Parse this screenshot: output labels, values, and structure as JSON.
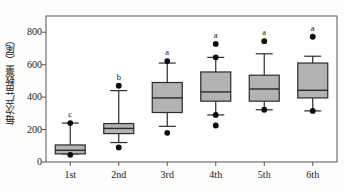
{
  "chart_data": {
    "type": "box",
    "title": "",
    "xlabel": "",
    "ylabel": "每次产苗数量（尾）",
    "ylim": [
      0,
      900
    ],
    "yticks": [
      0,
      200,
      400,
      600,
      800
    ],
    "ytick_labels": [
      "0",
      "200",
      "400",
      "600",
      "800"
    ],
    "grid": false,
    "legend": null,
    "categories": [
      "1st",
      "2nd",
      "3rd",
      "4th",
      "5th",
      "6th"
    ],
    "box_fill": "#b3b3b3",
    "box_edge": "#2b2b2b",
    "series": [
      {
        "name": "1st",
        "category": "1st",
        "q1": 50,
        "median": 72,
        "q3": 105,
        "whisker_low": 50,
        "whisker_high": 240,
        "outliers": [
          44,
          240
        ],
        "sig_letter": "c"
      },
      {
        "name": "2nd",
        "category": "2nd",
        "q1": 175,
        "median": 207,
        "q3": 237,
        "whisker_low": 120,
        "whisker_high": 440,
        "outliers": [
          90,
          470
        ],
        "sig_letter": "b"
      },
      {
        "name": "3rd",
        "category": "3rd",
        "q1": 305,
        "median": 395,
        "q3": 490,
        "whisker_low": 220,
        "whisker_high": 610,
        "outliers": [
          180,
          622
        ],
        "sig_letter": "a"
      },
      {
        "name": "4th",
        "category": "4th",
        "q1": 375,
        "median": 432,
        "q3": 555,
        "whisker_low": 290,
        "whisker_high": 645,
        "outliers": [
          225,
          290,
          645,
          728
        ],
        "sig_letter": "a"
      },
      {
        "name": "5th",
        "category": "5th",
        "q1": 375,
        "median": 450,
        "q3": 535,
        "whisker_low": 322,
        "whisker_high": 667,
        "outliers": [
          322,
          745
        ],
        "sig_letter": "a"
      },
      {
        "name": "6th",
        "category": "6th",
        "q1": 395,
        "median": 442,
        "q3": 610,
        "whisker_low": 315,
        "whisker_high": 652,
        "outliers": [
          315,
          772
        ],
        "sig_letter": "a"
      }
    ]
  }
}
